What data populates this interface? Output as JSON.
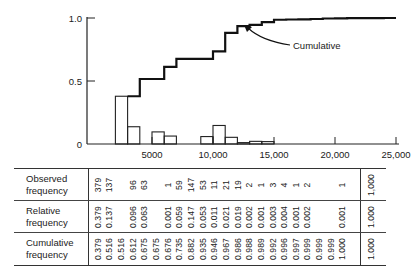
{
  "chart_data": {
    "type": "bar",
    "title": "",
    "xlabel": "",
    "ylabel": "",
    "xlim": [
      0,
      25000
    ],
    "ylim": [
      0,
      1.0
    ],
    "x_ticks": [
      "5000",
      "10,000",
      "15,000",
      "20,000",
      "25,000"
    ],
    "x_tick_values": [
      5000,
      10000,
      15000,
      20000,
      25000
    ],
    "y_ticks": [
      "0",
      "0.5",
      "1.0"
    ],
    "y_tick_values": [
      0,
      0.5,
      1.0
    ],
    "grid": false,
    "bin_width": 1000,
    "bin_starts": [
      2000,
      3000,
      4000,
      5000,
      6000,
      7000,
      8000,
      9000,
      10000,
      11000,
      12000,
      13000,
      14000,
      15000,
      16000,
      17000,
      18000,
      19000,
      20000,
      21000,
      22000,
      23000
    ],
    "series": [
      {
        "name": "Relative frequency (histogram)",
        "type": "bar",
        "values": [
          0.379,
          0.137,
          0,
          0.096,
          0.063,
          0,
          0.001,
          0.059,
          0.147,
          0.053,
          0.011,
          0.021,
          0.019,
          0.002,
          0.001,
          0.003,
          0.004,
          0.001,
          0.002,
          0,
          0,
          0.001
        ]
      },
      {
        "name": "Cumulative",
        "type": "step",
        "values": [
          0.379,
          0.516,
          0.516,
          0.612,
          0.675,
          0.675,
          0.676,
          0.735,
          0.882,
          0.935,
          0.946,
          0.967,
          0.986,
          0.988,
          0.989,
          0.992,
          0.996,
          0.997,
          0.999,
          0.999,
          0.999,
          1.0
        ]
      }
    ],
    "annotations": [
      {
        "text": "Cumulative",
        "points_to": "cumulative step curve"
      }
    ]
  },
  "table": {
    "rows": [
      {
        "label": "Observed frequency",
        "values": [
          "379",
          "137",
          "",
          "96",
          "63",
          "",
          "1",
          "59",
          "147",
          "53",
          "11",
          "21",
          "19",
          "2",
          "1",
          "3",
          "4",
          "1",
          "2",
          "",
          "",
          "1"
        ],
        "total": "1,000"
      },
      {
        "label": "Relative frequency",
        "values": [
          "0.379",
          "0.137",
          "",
          "0.096",
          "0.063",
          "",
          "0.001",
          "0.059",
          "0.147",
          "0.053",
          "0.011",
          "0.021",
          "0.019",
          "0.002",
          "0.001",
          "0.003",
          "0.004",
          "0.001",
          "0.002",
          "",
          "",
          "0.001"
        ],
        "total": "1.000"
      },
      {
        "label": "Cumulative frequency",
        "values": [
          "0.379",
          "0.516",
          "0.516",
          "0.612",
          "0.675",
          "0.675",
          "0.676",
          "0.735",
          "0.882",
          "0.935",
          "0.946",
          "0.967",
          "0.986",
          "0.988",
          "0.989",
          "0.992",
          "0.996",
          "0.997",
          "0.999",
          "0.999",
          "0.999",
          "1.000"
        ],
        "total": "1.000"
      }
    ]
  },
  "annotation_label": "Cumulative"
}
